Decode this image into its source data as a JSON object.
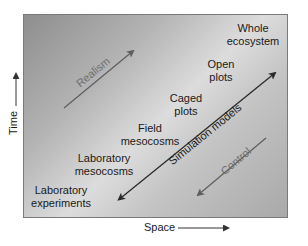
{
  "diagram": {
    "axes": {
      "x_label": "Space",
      "y_label": "Time"
    },
    "scales": [
      {
        "id": "lab-experiments",
        "label": "Laboratory\nexperiments"
      },
      {
        "id": "lab-mesocosms",
        "label": "Laboratory\nmesocosms"
      },
      {
        "id": "field-mesocosms",
        "label": "Field\nmesocosms"
      },
      {
        "id": "caged-plots",
        "label": "Caged\nplots"
      },
      {
        "id": "open-plots",
        "label": "Open\nplots"
      },
      {
        "id": "whole-ecosystem",
        "label": "Whole\necosystem"
      }
    ],
    "arrows": {
      "realism": "Realism",
      "simulation_models": "Simulation models",
      "control": "Control"
    },
    "colors": {
      "panel_dark": "#8e8e8e",
      "panel_light": "#dcdcdc",
      "panel_border": "#7a7a7a",
      "text": "#1a1a1a",
      "faded_arrow": "#6e6e6e",
      "main_arrow": "#2a2a2a"
    }
  }
}
